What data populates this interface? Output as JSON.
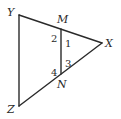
{
  "figure": {
    "type": "triangle-with-segment",
    "stroke_color": "#2a2a2a",
    "background": "#ffffff",
    "vertices": {
      "Y": {
        "label": "Y",
        "x": 19,
        "y": 15,
        "label_x": 7,
        "label_y": 16
      },
      "M": {
        "label": "M",
        "x": 61,
        "y": 29,
        "label_x": 57,
        "label_y": 23
      },
      "X": {
        "label": "X",
        "x": 102,
        "y": 43,
        "label_x": 105,
        "label_y": 47
      },
      "N": {
        "label": "N",
        "x": 61,
        "y": 74,
        "label_x": 57,
        "label_y": 88
      },
      "Z": {
        "label": "Z",
        "x": 19,
        "y": 106,
        "label_x": 7,
        "label_y": 113
      }
    },
    "segments": [
      {
        "from": "Y",
        "to": "X"
      },
      {
        "from": "Y",
        "to": "Z"
      },
      {
        "from": "Z",
        "to": "X"
      },
      {
        "from": "M",
        "to": "N"
      }
    ],
    "angles": [
      {
        "label": "2",
        "x": 51,
        "y": 42
      },
      {
        "label": "1",
        "x": 65,
        "y": 47
      },
      {
        "label": "3",
        "x": 65,
        "y": 67
      },
      {
        "label": "4",
        "x": 51,
        "y": 76
      }
    ]
  }
}
